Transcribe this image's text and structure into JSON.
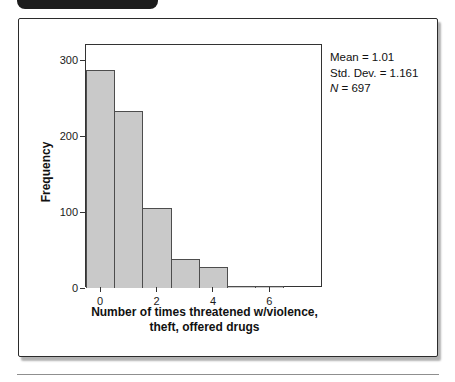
{
  "figure": {
    "stats": {
      "mean": "Mean = 1.01",
      "std_dev": "Std. Dev. = 1.161",
      "n_symbol": "N",
      "n_rest": " = 697"
    }
  },
  "chart_data": {
    "type": "bar",
    "subtype": "histogram",
    "categories": [
      0,
      1,
      2,
      3,
      4,
      5,
      6
    ],
    "values": [
      287,
      233,
      106,
      38,
      27,
      3,
      3
    ],
    "title": "",
    "xlabel": "Number of times threatened w/violence, theft, offered drugs",
    "xlabel_lines": [
      "Number of times threatened w/violence,",
      "theft, offered drugs"
    ],
    "ylabel": "Frequency",
    "xlim": [
      -0.5,
      7.9
    ],
    "ylim": [
      0,
      320
    ],
    "x_ticks": [
      0,
      2,
      4,
      6
    ],
    "y_ticks": [
      0,
      100,
      200,
      300
    ],
    "grid": false,
    "legend": null,
    "annotations": [
      "Mean = 1.01",
      "Std. Dev. = 1.161",
      "N = 697"
    ],
    "colors": {
      "bar_fill": "#c9c9c9",
      "bar_border": "#4d4d4d",
      "axis": "#333333",
      "tab": "#1c1c1c"
    }
  }
}
